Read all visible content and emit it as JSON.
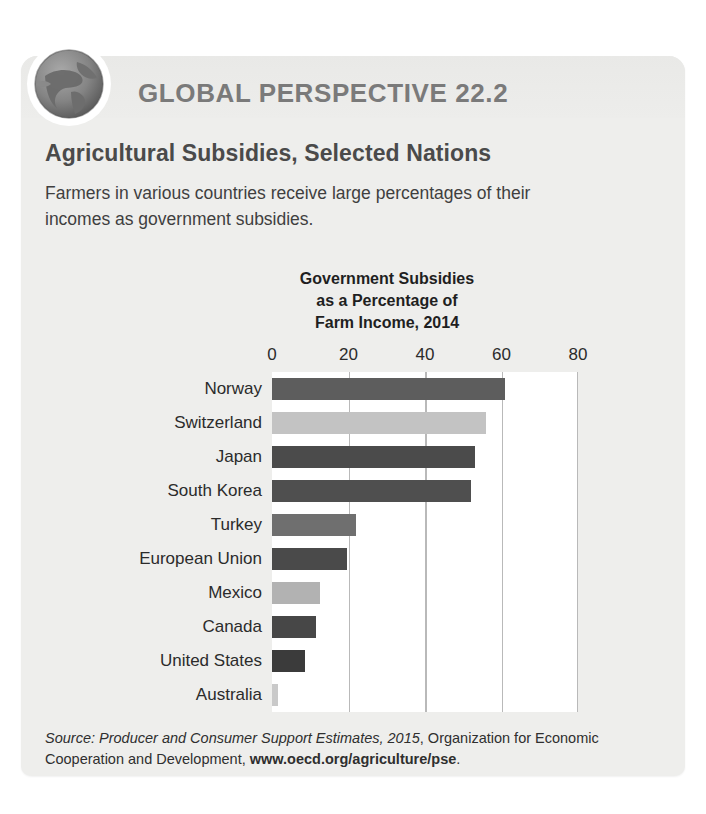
{
  "feature": {
    "kicker": "GLOBAL PERSPECTIVE 22.2",
    "title": "Agricultural Subsidies, Selected Nations",
    "description": "Farmers in various countries receive large percentages of their incomes as government subsidies.",
    "icon": "globe-icon"
  },
  "chart_title_lines": {
    "line1": "Government Subsidies",
    "line2": "as a Percentage of",
    "line3": "Farm Income, 2014"
  },
  "source": {
    "label": "Source:",
    "italic_part": "Producer and Consumer Support Estimates, 2015",
    "middle_part": ", Organization for Economic Cooperation and Development, ",
    "url": "www.oecd.org/agriculture/pse",
    "period": "."
  },
  "colors": {
    "panel_background": "#eeeeec",
    "plot_background": "#ffffff",
    "gridline": "#b9b9b9",
    "kicker_text": "#7a7a7a",
    "title_text": "#4a4a4a",
    "body_text": "#3f3f3f"
  },
  "chart_data": {
    "type": "bar",
    "orientation": "horizontal",
    "title": "Government Subsidies as a Percentage of Farm Income, 2014",
    "xlabel": "",
    "ylabel": "",
    "xlim": [
      0,
      80
    ],
    "xticks": [
      0,
      20,
      40,
      60,
      80
    ],
    "xtick_labels": [
      "0",
      "20",
      "40",
      "60",
      "80"
    ],
    "grid": true,
    "grid_axis": "x",
    "legend": false,
    "categories": [
      "Norway",
      "Switzerland",
      "Japan",
      "South Korea",
      "Turkey",
      "European Union",
      "Mexico",
      "Canada",
      "United States",
      "Australia"
    ],
    "values": [
      61,
      56,
      53,
      52,
      22,
      19.5,
      12.5,
      11.5,
      8.5,
      1.5
    ],
    "bar_colors": [
      "#5d5d5d",
      "#c3c3c3",
      "#4b4b4b",
      "#4f4f4f",
      "#6f6f6f",
      "#4a4a4a",
      "#b2b2b2",
      "#474747",
      "#3b3b3b",
      "#c9c9c9"
    ]
  }
}
